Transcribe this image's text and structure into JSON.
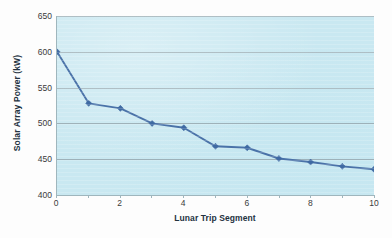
{
  "chart_data": {
    "type": "line",
    "title": "",
    "xlabel": "Lunar Trip Segment",
    "ylabel": "Solar Array Power (kW)",
    "x": [
      0,
      1,
      2,
      3,
      4,
      5,
      6,
      7,
      8,
      9,
      10
    ],
    "values": [
      600,
      528,
      521,
      500,
      494,
      468,
      466,
      451,
      446,
      440,
      436
    ],
    "series": [
      {
        "name": "Solar Array Power",
        "values": [
          600,
          528,
          521,
          500,
          494,
          468,
          466,
          451,
          446,
          440,
          436
        ]
      }
    ],
    "xlim": [
      0,
      10
    ],
    "ylim": [
      400,
      650
    ],
    "y_ticks": [
      400,
      450,
      500,
      550,
      600,
      650
    ],
    "y_tick_labels": [
      "400",
      "450",
      "500",
      "550",
      "600",
      "650"
    ],
    "x_ticks": [
      0,
      2,
      4,
      6,
      8,
      10
    ],
    "x_tick_labels": [
      "0",
      "2",
      "4",
      "6",
      "8",
      "10"
    ],
    "x_minor_ticks": [
      1,
      3,
      5,
      7,
      9
    ],
    "grid": "horizontal",
    "legend": "none",
    "marker": "diamond",
    "colors": {
      "line": "#4a72a8",
      "marker": "#3f6aa3",
      "plot_background": "#c9e8f1",
      "gridline": "#8f9fa6",
      "axis": "#9fb6bd",
      "text": "#23323f",
      "figure_background": "#fdfdfd"
    }
  }
}
